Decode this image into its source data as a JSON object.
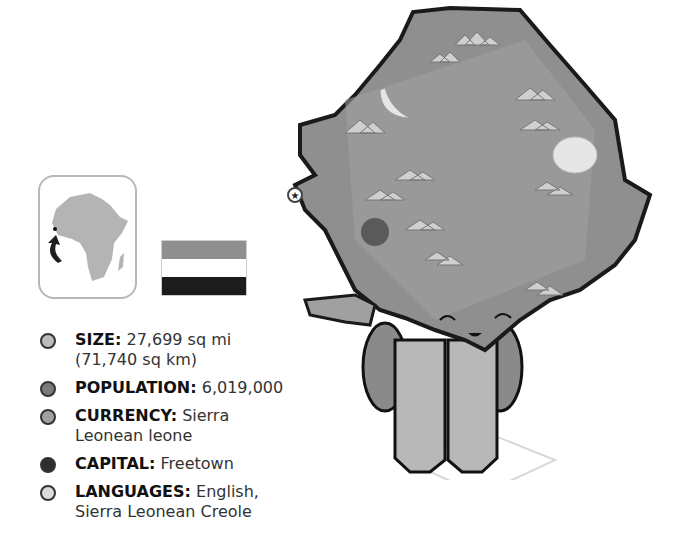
{
  "locator_map": {
    "region": "Africa",
    "marker": "Sierra Leone location arrow"
  },
  "flag": {
    "country": "Sierra Leone",
    "stripes": [
      "#8f8f8f",
      "#ffffff",
      "#1c1c1c"
    ]
  },
  "facts": [
    {
      "key": "SIZE:",
      "value": "27,699 sq mi",
      "value2": "(71,740 sq km)",
      "bullet_color": "#bdbdbd"
    },
    {
      "key": "POPULATION:",
      "value": "6,019,000",
      "bullet_color": "#7a7a7a"
    },
    {
      "key": "CURRENCY:",
      "value": "Sierra Leonean leone",
      "bullet_color": "#a0a0a0"
    },
    {
      "key": "CAPITAL:",
      "value": "Freetown",
      "bullet_color": "#2e2e2e"
    },
    {
      "key": "LANGUAGES:",
      "value": "English,",
      "value2": "Sierra Leonean Creole",
      "bullet_color": "#dcdcdc"
    }
  ],
  "map": {
    "country": "Sierra Leone",
    "capital_marker": "star",
    "fill": "#8f8f8f",
    "outline": "#1a1a1a"
  }
}
